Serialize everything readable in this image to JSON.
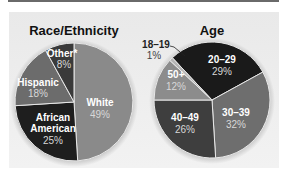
{
  "chart_data": [
    {
      "type": "pie",
      "title": "Race/Ethnicity",
      "categories": [
        "White",
        "African American",
        "Hispanic",
        "Other*"
      ],
      "values": [
        49,
        25,
        18,
        8
      ],
      "unit": "%",
      "colors": [
        "#8a8a8a",
        "#1e1e1e",
        "#6c6c6c",
        "#3a3a3a"
      ],
      "start_angle": "12 o'clock",
      "direction": "clockwise",
      "labels": {
        "White": "49%",
        "African American": "25%",
        "Hispanic": "18%",
        "Other*": "8%"
      }
    },
    {
      "type": "pie",
      "title": "Age",
      "categories": [
        "20–29",
        "30–39",
        "40–49",
        "50+",
        "18–19"
      ],
      "values": [
        29,
        32,
        26,
        12,
        1
      ],
      "unit": "%",
      "colors": [
        "#1a1a1a",
        "#6e6e6e",
        "#3e3e3e",
        "#8c8c8c",
        "#b5b5b5"
      ],
      "direction": "clockwise",
      "labels": {
        "20–29": "29%",
        "30–39": "32%",
        "40–49": "26%",
        "50+": "12%",
        "18–19": "1%"
      }
    }
  ],
  "race": {
    "title": "Race/Ethnicity",
    "white": {
      "label": "White",
      "pct": "49%"
    },
    "african_american": {
      "label1": "African",
      "label2": "American",
      "pct": "25%"
    },
    "hispanic": {
      "label": "Hispanic",
      "pct": "18%"
    },
    "other": {
      "label": "Other*",
      "pct": "8%"
    }
  },
  "age": {
    "title": "Age",
    "a20": {
      "label": "20–29",
      "pct": "29%"
    },
    "a30": {
      "label": "30–39",
      "pct": "32%"
    },
    "a40": {
      "label": "40–49",
      "pct": "26%"
    },
    "a50": {
      "label": "50+",
      "pct": "12%"
    },
    "a18": {
      "label": "18–19",
      "pct": "1%"
    }
  }
}
